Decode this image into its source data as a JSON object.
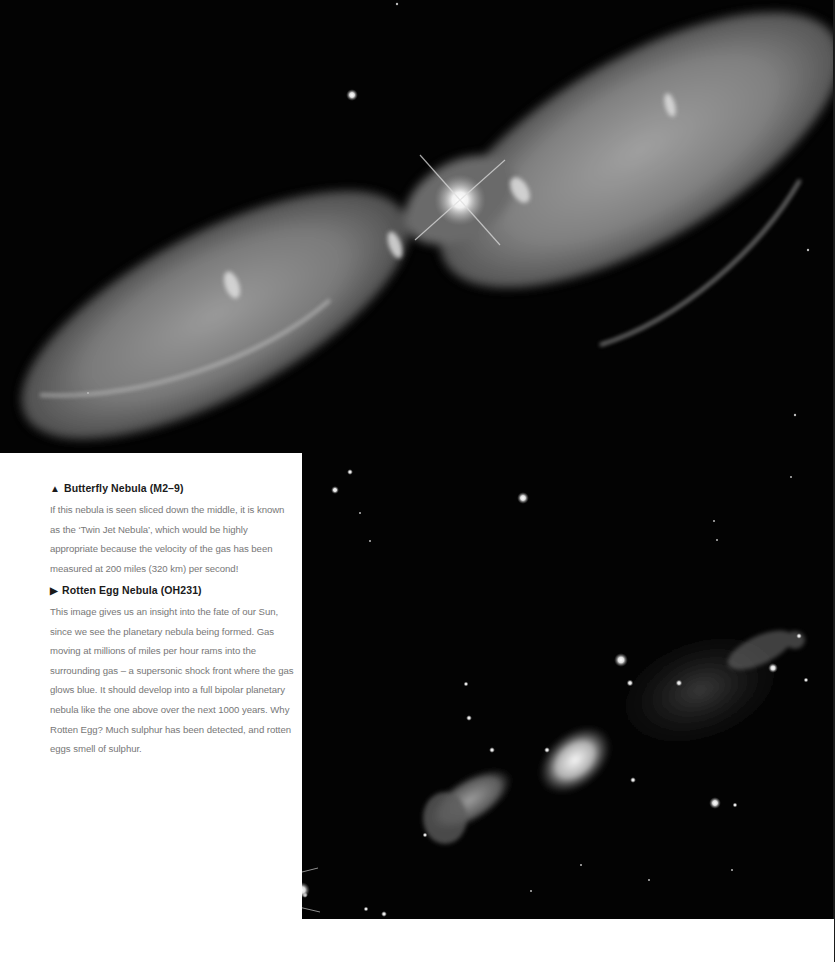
{
  "page": {
    "background": "#ffffff",
    "image_background": "#030303"
  },
  "images": [
    {
      "id": "butterfly-nebula-photo",
      "subject": "Butterfly Nebula (M2-9)",
      "description": "Bipolar twin-lobed nebula with bright central star, diagonal from lower-left to upper-right"
    },
    {
      "id": "rotten-egg-nebula-photo",
      "subject": "Rotten Egg Nebula (OH231)",
      "description": "Bipolar outflow nebula with starfield and faint gas clouds"
    }
  ],
  "captions": [
    {
      "marker": "▲",
      "marker_icon": "triangle-up-icon",
      "title": "Butterfly Nebula (M2–9)",
      "body": "If this nebula is seen sliced down the middle, it is known as the ‘Twin Jet Nebula’, which would be highly appropriate because the velocity of the gas has been measured at 200 miles (320 km) per second!"
    },
    {
      "marker": "▶",
      "marker_icon": "triangle-right-icon",
      "title": "Rotten Egg Nebula (OH231)",
      "body": "This image gives us an insight into the fate of our Sun, since we see the planetary nebula being formed. Gas moving at millions of miles per hour rams into the surrounding gas – a supersonic shock front where the gas glows blue. It should develop into a full bipolar planetary nebula like the one above over the next 1000 years. Why Rotten Egg? Much sulphur has been detected, and rotten eggs smell of sulphur."
    }
  ]
}
